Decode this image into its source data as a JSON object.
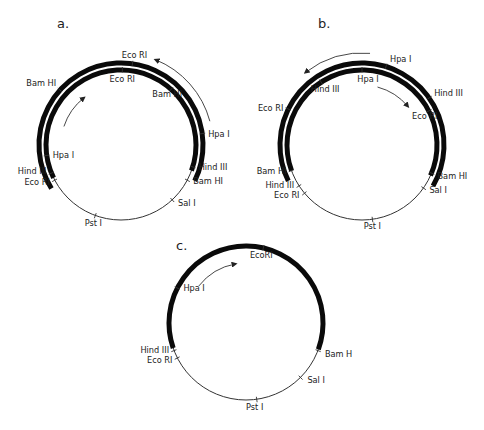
{
  "figure": {
    "panels": [
      {
        "id": "a",
        "letter": "a.",
        "letter_pos": [
          57,
          28
        ],
        "center": [
          121,
          145
        ],
        "radius": 75,
        "thick_arcs": [
          {
            "r": 82,
            "start": -122,
            "end": 116
          },
          {
            "r": 75,
            "start": -116,
            "end": 110
          }
        ],
        "sites": [
          {
            "name": "Eco RI",
            "r": 82,
            "angle": 8,
            "dx": 2,
            "dy": -6,
            "anchor": "middle"
          },
          {
            "name": "Bam HI",
            "r": 82,
            "angle": -48,
            "dx": -4,
            "dy": -4,
            "anchor": "end"
          },
          {
            "name": "Hpa I",
            "r": 82,
            "angle": 82,
            "dx": 6,
            "dy": 3,
            "anchor": "start"
          },
          {
            "name": "Eco RI",
            "r": 75,
            "angle": 1,
            "dx": 0,
            "dy": 12,
            "anchor": "middle"
          },
          {
            "name": "Bam HI",
            "r": 75,
            "angle": 42,
            "dx": -4,
            "dy": 8,
            "anchor": "middle"
          },
          {
            "name": "Hpa I",
            "r": 75,
            "angle": -98,
            "dx": 6,
            "dy": 3,
            "anchor": "start"
          },
          {
            "name": "Hind III",
            "r": 75,
            "angle": 107,
            "dx": 6,
            "dy": 3,
            "anchor": "start"
          },
          {
            "name": "Hind III",
            "r": 75,
            "angle": -112,
            "dx": -5,
            "dy": 1,
            "anchor": "end"
          },
          {
            "name": "Eco RI",
            "r": 75,
            "angle": -118,
            "dx": -5,
            "dy": 5,
            "anchor": "end"
          },
          {
            "name": "Bam HI",
            "r": 75,
            "angle": 118,
            "dx": 6,
            "dy": 4,
            "anchor": "start"
          },
          {
            "name": "Sal I",
            "r": 75,
            "angle": 137,
            "dx": 6,
            "dy": 6,
            "anchor": "start"
          },
          {
            "name": "Pst I",
            "r": 75,
            "angle": -160,
            "dx": -2,
            "dy": 10,
            "anchor": "middle"
          }
        ],
        "arrows": [
          {
            "r": 60,
            "start": -72,
            "end": -38
          },
          {
            "r": 92,
            "start": 75,
            "end": 22
          }
        ]
      },
      {
        "id": "b",
        "letter": "b.",
        "letter_pos": [
          318,
          28
        ],
        "center": [
          362,
          145
        ],
        "radius": 75,
        "thick_arcs": [
          {
            "r": 82,
            "start": -116,
            "end": 120
          },
          {
            "r": 75,
            "start": -110,
            "end": 114
          }
        ],
        "sites": [
          {
            "name": "Hpa I",
            "r": 82,
            "angle": 17,
            "dx": 4,
            "dy": -5,
            "anchor": "start"
          },
          {
            "name": "Hind III",
            "r": 82,
            "angle": 55,
            "dx": 5,
            "dy": -2,
            "anchor": "start"
          },
          {
            "name": "Eco RI",
            "r": 82,
            "angle": -64,
            "dx": -5,
            "dy": 2,
            "anchor": "end"
          },
          {
            "name": "Hpa I",
            "r": 75,
            "angle": 0,
            "dx": 6,
            "dy": 12,
            "anchor": "middle"
          },
          {
            "name": "Hind III",
            "r": 75,
            "angle": -33,
            "dx": 4,
            "dy": 10,
            "anchor": "middle"
          },
          {
            "name": "Eco RI",
            "r": 75,
            "angle": 63,
            "dx": -4,
            "dy": 8,
            "anchor": "middle"
          },
          {
            "name": "Bam HI",
            "r": 75,
            "angle": -110,
            "dx": -5,
            "dy": 3,
            "anchor": "end"
          },
          {
            "name": "Bam HI",
            "r": 75,
            "angle": 112,
            "dx": 6,
            "dy": 6,
            "anchor": "start"
          },
          {
            "name": "Hind III",
            "r": 75,
            "angle": -123,
            "dx": -5,
            "dy": 2,
            "anchor": "end"
          },
          {
            "name": "Eco RI",
            "r": 75,
            "angle": -130,
            "dx": -5,
            "dy": 5,
            "anchor": "end"
          },
          {
            "name": "Sal I",
            "r": 75,
            "angle": 125,
            "dx": 6,
            "dy": 5,
            "anchor": "start"
          },
          {
            "name": "Pst I",
            "r": 75,
            "angle": 172,
            "dx": 0,
            "dy": 10,
            "anchor": "middle"
          }
        ],
        "arrows": [
          {
            "r": 92,
            "start": 5,
            "end": -38
          },
          {
            "r": 60,
            "start": 15,
            "end": 50
          }
        ]
      },
      {
        "id": "c",
        "letter": "c.",
        "letter_pos": [
          176,
          250
        ],
        "center": [
          246,
          323
        ],
        "radius": 77,
        "thick_arcs": [
          {
            "r": 77,
            "start": -109,
            "end": 110
          }
        ],
        "sites": [
          {
            "name": "EcoRI",
            "r": 77,
            "angle": 13,
            "dx": -2,
            "dy": 10,
            "anchor": "middle"
          },
          {
            "name": "Hpa I",
            "r": 77,
            "angle": -63,
            "dx": 6,
            "dy": 3,
            "anchor": "start"
          },
          {
            "name": "Hind III",
            "r": 77,
            "angle": -111,
            "dx": -5,
            "dy": 2,
            "anchor": "end"
          },
          {
            "name": "Eco RI",
            "r": 77,
            "angle": -117,
            "dx": -5,
            "dy": 5,
            "anchor": "end"
          },
          {
            "name": "Bam H",
            "r": 77,
            "angle": 111,
            "dx": 7,
            "dy": 6,
            "anchor": "start"
          },
          {
            "name": "Sal I",
            "r": 77,
            "angle": 135,
            "dx": 7,
            "dy": 6,
            "anchor": "start"
          },
          {
            "name": "Pst I",
            "r": 77,
            "angle": 172,
            "dx": -2,
            "dy": 11,
            "anchor": "middle"
          }
        ],
        "arrows": [
          {
            "r": 60,
            "start": -52,
            "end": -10
          }
        ]
      }
    ],
    "colors": {
      "ink": "#222222",
      "thick": "#0a0a0a",
      "background": "#ffffff"
    }
  }
}
